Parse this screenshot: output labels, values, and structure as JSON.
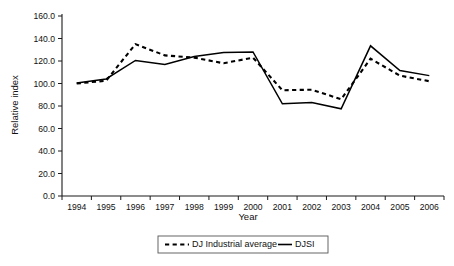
{
  "chart_data": {
    "type": "line",
    "title": "",
    "xlabel": "Year",
    "ylabel": "Relative index",
    "categories": [
      "1994",
      "1995",
      "1996",
      "1997",
      "1998",
      "1999",
      "2000",
      "2001",
      "2002",
      "2003",
      "2004",
      "2005",
      "2006"
    ],
    "x": [
      1994,
      1995,
      1996,
      1997,
      1998,
      1999,
      2000,
      2001,
      2002,
      2003,
      2004,
      2005,
      2006
    ],
    "ylim": [
      0.0,
      160.0
    ],
    "yticks": [
      "0.0",
      "20.0",
      "40.0",
      "60.0",
      "80.0",
      "100.0",
      "120.0",
      "140.0",
      "160.0"
    ],
    "ytick_values": [
      0.0,
      20.0,
      40.0,
      60.0,
      80.0,
      100.0,
      120.0,
      140.0,
      160.0
    ],
    "grid": false,
    "legend_position": "bottom",
    "series": [
      {
        "name": "DJ Industrial average",
        "style": "dashed",
        "values": [
          100.0,
          102.5,
          135.0,
          125.0,
          123.0,
          118.0,
          123.0,
          94.0,
          94.5,
          86.0,
          122.0,
          107.0,
          102.0
        ]
      },
      {
        "name": "DJSI",
        "style": "solid",
        "values": [
          100.5,
          104.0,
          120.5,
          117.0,
          124.0,
          127.5,
          128.0,
          82.0,
          83.0,
          77.5,
          133.5,
          111.5,
          107.0
        ]
      }
    ]
  },
  "legend": {
    "entries": [
      {
        "label": "DJ Industrial average",
        "style": "dashed"
      },
      {
        "label": "DJSI",
        "style": "solid"
      }
    ]
  }
}
